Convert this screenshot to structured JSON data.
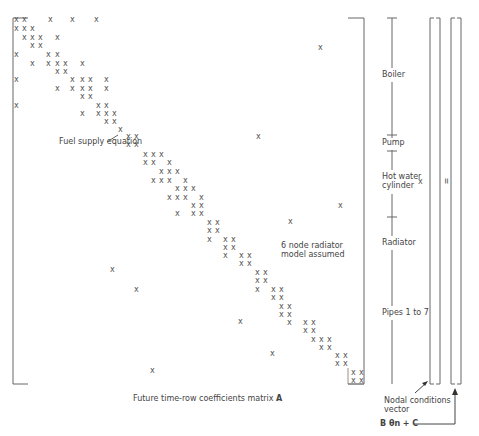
{
  "labels": {
    "fuel_supply": "Fuel supply equation",
    "radiator_model_line1": "6 node radiator",
    "radiator_model_line2": "model assumed",
    "matrix_caption": "Future time-row coefficients matrix",
    "matrix_symbol": "A",
    "nodal_line1": "Nodal conditions",
    "nodal_line2": "vector",
    "rhs_formula": "B θn + C",
    "times": "×",
    "equals": "="
  },
  "sections": [
    {
      "name": "Boiler",
      "y": 75
    },
    {
      "name": "Pump",
      "y": 143
    },
    {
      "name": "Hot water",
      "y": 177
    },
    {
      "name": "cylinder",
      "y": 186
    },
    {
      "name": "Radiator",
      "y": 243
    },
    {
      "name": "Pipes 1 to 7",
      "y": 313
    }
  ],
  "matrix_entries": [
    [
      14,
      20
    ],
    [
      22,
      20
    ],
    [
      48,
      20
    ],
    [
      70,
      20
    ],
    [
      94,
      20
    ],
    [
      14,
      29
    ],
    [
      22,
      29
    ],
    [
      30,
      29
    ],
    [
      22,
      38
    ],
    [
      30,
      38
    ],
    [
      38,
      38
    ],
    [
      55,
      38
    ],
    [
      30,
      46
    ],
    [
      38,
      46
    ],
    [
      14,
      55
    ],
    [
      46,
      55
    ],
    [
      55,
      55
    ],
    [
      30,
      64
    ],
    [
      46,
      64
    ],
    [
      55,
      64
    ],
    [
      63,
      64
    ],
    [
      80,
      64
    ],
    [
      55,
      72
    ],
    [
      63,
      72
    ],
    [
      14,
      80
    ],
    [
      70,
      80
    ],
    [
      80,
      80
    ],
    [
      88,
      80
    ],
    [
      104,
      80
    ],
    [
      55,
      89
    ],
    [
      70,
      89
    ],
    [
      80,
      89
    ],
    [
      88,
      89
    ],
    [
      104,
      89
    ],
    [
      80,
      97
    ],
    [
      88,
      97
    ],
    [
      14,
      106
    ],
    [
      96,
      106
    ],
    [
      104,
      106
    ],
    [
      80,
      114
    ],
    [
      96,
      114
    ],
    [
      104,
      114
    ],
    [
      112,
      114
    ],
    [
      104,
      122
    ],
    [
      112,
      122
    ],
    [
      118,
      130
    ],
    [
      126,
      137
    ],
    [
      134,
      137
    ],
    [
      126,
      145
    ],
    [
      134,
      145
    ],
    [
      143,
      155
    ],
    [
      151,
      155
    ],
    [
      159,
      155
    ],
    [
      143,
      163
    ],
    [
      151,
      163
    ],
    [
      167,
      163
    ],
    [
      159,
      172
    ],
    [
      167,
      172
    ],
    [
      175,
      172
    ],
    [
      151,
      181
    ],
    [
      159,
      181
    ],
    [
      167,
      181
    ],
    [
      183,
      181
    ],
    [
      175,
      189
    ],
    [
      183,
      189
    ],
    [
      191,
      189
    ],
    [
      167,
      198
    ],
    [
      175,
      198
    ],
    [
      183,
      198
    ],
    [
      199,
      198
    ],
    [
      191,
      206
    ],
    [
      199,
      206
    ],
    [
      175,
      214
    ],
    [
      191,
      214
    ],
    [
      199,
      214
    ],
    [
      207,
      223
    ],
    [
      215,
      223
    ],
    [
      207,
      231
    ],
    [
      215,
      231
    ],
    [
      207,
      240
    ],
    [
      223,
      240
    ],
    [
      231,
      240
    ],
    [
      223,
      248
    ],
    [
      231,
      248
    ],
    [
      223,
      256
    ],
    [
      239,
      256
    ],
    [
      247,
      256
    ],
    [
      239,
      264
    ],
    [
      247,
      264
    ],
    [
      255,
      273
    ],
    [
      263,
      273
    ],
    [
      255,
      281
    ],
    [
      263,
      281
    ],
    [
      255,
      290
    ],
    [
      271,
      290
    ],
    [
      279,
      290
    ],
    [
      271,
      298
    ],
    [
      279,
      298
    ],
    [
      279,
      307
    ],
    [
      287,
      307
    ],
    [
      279,
      315
    ],
    [
      287,
      315
    ],
    [
      287,
      323
    ],
    [
      303,
      323
    ],
    [
      311,
      323
    ],
    [
      303,
      331
    ],
    [
      311,
      331
    ],
    [
      311,
      340
    ],
    [
      319,
      340
    ],
    [
      327,
      340
    ],
    [
      319,
      348
    ],
    [
      327,
      348
    ],
    [
      335,
      356
    ],
    [
      343,
      356
    ],
    [
      335,
      364
    ],
    [
      343,
      364
    ],
    [
      351,
      373
    ],
    [
      359,
      373
    ],
    [
      351,
      381
    ],
    [
      359,
      381
    ],
    [
      318,
      48
    ],
    [
      256,
      137
    ],
    [
      338,
      206
    ],
    [
      288,
      222
    ],
    [
      110,
      270
    ],
    [
      134,
      290
    ],
    [
      238,
      322
    ],
    [
      270,
      354
    ],
    [
      150,
      371
    ],
    [
      418,
      182
    ]
  ]
}
